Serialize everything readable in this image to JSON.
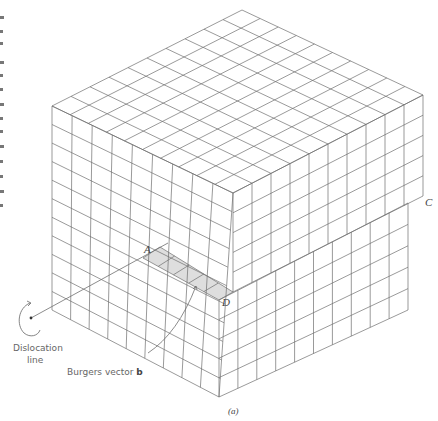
{
  "figure": {
    "caption": "(a)",
    "labels": {
      "A": "A",
      "C": "C",
      "D": "D",
      "dislocation_line_1": "Dislocation",
      "dislocation_line_2": "line",
      "burgers_prefix": "Burgers vector ",
      "burgers_symbol": "b"
    },
    "colors": {
      "grid_line": "#6f6f6f",
      "shaded_step": "#dedede",
      "label_text": "#555555",
      "background": "#ffffff"
    },
    "geometry": {
      "top_face": {
        "apex": [
          242,
          10
        ],
        "left": [
          52,
          106
        ],
        "right": [
          423,
          95
        ],
        "front": [
          233,
          193
        ],
        "divisions_a": 10,
        "divisions_b": 10
      },
      "left_face": {
        "top_left": [
          52,
          106
        ],
        "top_right": [
          233,
          193
        ],
        "bottom_left": [
          52,
          310
        ],
        "bottom_right": [
          219,
          397
        ],
        "cols": 9,
        "rows": 11
      },
      "right_face_upper": {
        "top_left": [
          233,
          193
        ],
        "top_right": [
          423,
          95
        ],
        "bottom_left": [
          233,
          292
        ],
        "bottom_right": [
          423,
          196
        ],
        "cols": 10,
        "rows": 5
      },
      "right_face_lower": {
        "top_left": [
          219,
          300
        ],
        "top_right": [
          408,
          203
        ],
        "bottom_left": [
          219,
          397
        ],
        "bottom_right": [
          408,
          310
        ],
        "cols": 10,
        "rows": 5
      },
      "step_shelf": [
        [
          143,
          258
        ],
        [
          160,
          247
        ],
        [
          233,
          292
        ],
        [
          219,
          300
        ]
      ],
      "dislocation_pointer": [
        [
          31,
          318
        ],
        [
          168,
          243
        ]
      ],
      "burgers_pointer": [
        [
          148,
          353
        ],
        [
          196,
          286
        ]
      ]
    },
    "left_margin_fragments": [
      16,
      30,
      42,
      61,
      74,
      88,
      103,
      117,
      130,
      145,
      160,
      175,
      190,
      204
    ]
  }
}
